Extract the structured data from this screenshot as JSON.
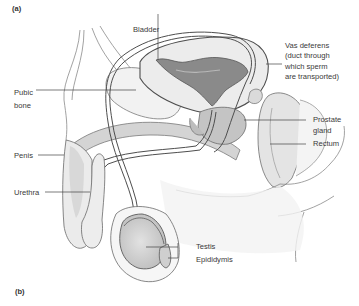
{
  "figure": {
    "panel_a_label": "(a)",
    "panel_b_label": "(b)"
  },
  "labels": {
    "bladder": "Bladder",
    "vas_deferens_line1": "Vas deferens",
    "vas_deferens_line2": "(duct through",
    "vas_deferens_line3": "which sperm",
    "vas_deferens_line4": "are transported)",
    "pubic_bone_line1": "Pubic",
    "pubic_bone_line2": "bone",
    "prostate_line1": "Prostate",
    "prostate_line2": "gland",
    "rectum": "Rectum",
    "penis": "Penis",
    "urethra": "Urethra",
    "testis": "Testis",
    "epididymis": "Epididymis"
  },
  "colors": {
    "outline": "#555555",
    "shade_light": "#e6e6e6",
    "shade_mid": "#c8c8c8",
    "bladder_interior": "#8a8a8a",
    "text": "#3a3a3a",
    "leader_line": "#444444"
  }
}
